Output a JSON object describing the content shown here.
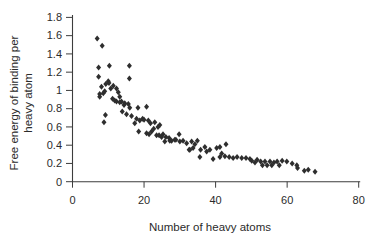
{
  "figure": {
    "background": "#ffffff",
    "marker_color": "#2e2e2e",
    "axis_color": "#3d3d3d",
    "text_color": "#2b2b2b"
  },
  "chart_data": {
    "type": "scatter",
    "title": "",
    "xlabel": "Number of heavy atoms",
    "ylabel": "Free energy of binding per heavy atom",
    "ylabel_lines": [
      "Free energy of binding per",
      "heavy atom"
    ],
    "xlim": [
      0,
      80
    ],
    "ylim": [
      0,
      1.8
    ],
    "xtick_values": [
      0,
      20,
      40,
      60,
      80
    ],
    "xtick_labels": [
      "0",
      "20",
      "40",
      "60",
      "80"
    ],
    "ytick_values": [
      0,
      0.2,
      0.4,
      0.6,
      0.8,
      1,
      1.2,
      1.4,
      1.6,
      1.8
    ],
    "ytick_labels": [
      "0",
      "0.2",
      "0.4",
      "0.6",
      "0.8",
      "1",
      "1.2",
      "1.4",
      "1.6",
      "1.8"
    ],
    "grid": false,
    "legend": null,
    "marker": "filled-diamond",
    "points": [
      [
        6.9,
        1.57
      ],
      [
        7.3,
        1.25
      ],
      [
        7.3,
        1.15
      ],
      [
        7.6,
        0.96
      ],
      [
        7.6,
        0.93
      ],
      [
        8.1,
        1.04
      ],
      [
        8.3,
        1.49
      ],
      [
        8.6,
        0.97
      ],
      [
        8.8,
        0.65
      ],
      [
        9.0,
        0.99
      ],
      [
        9.2,
        0.73
      ],
      [
        9.3,
        1.07
      ],
      [
        10.0,
        1.1
      ],
      [
        10.2,
        1.08
      ],
      [
        10.3,
        1.27
      ],
      [
        10.7,
        1.02
      ],
      [
        11.2,
        0.91
      ],
      [
        11.4,
        1.05
      ],
      [
        11.8,
        0.89
      ],
      [
        12.3,
        1.02
      ],
      [
        12.3,
        0.88
      ],
      [
        12.8,
        0.98
      ],
      [
        13.2,
        0.93
      ],
      [
        13.2,
        0.87
      ],
      [
        13.7,
        0.88
      ],
      [
        13.9,
        0.77
      ],
      [
        14.4,
        0.84
      ],
      [
        14.6,
        0.86
      ],
      [
        15.1,
        0.74
      ],
      [
        15.6,
        0.85
      ],
      [
        15.9,
        1.27
      ],
      [
        15.9,
        1.13
      ],
      [
        16.0,
        0.81
      ],
      [
        16.5,
        0.72
      ],
      [
        17.4,
        0.64
      ],
      [
        17.9,
        0.69
      ],
      [
        18.3,
        0.81
      ],
      [
        18.5,
        0.55
      ],
      [
        18.8,
        0.67
      ],
      [
        19.6,
        0.69
      ],
      [
        20.0,
        0.68
      ],
      [
        20.7,
        0.82
      ],
      [
        20.7,
        0.53
      ],
      [
        21.2,
        0.67
      ],
      [
        21.4,
        0.52
      ],
      [
        21.8,
        0.64
      ],
      [
        22.1,
        0.55
      ],
      [
        22.7,
        0.58
      ],
      [
        23.0,
        0.65
      ],
      [
        23.5,
        0.51
      ],
      [
        23.9,
        0.6
      ],
      [
        24.2,
        0.51
      ],
      [
        24.4,
        0.62
      ],
      [
        24.9,
        0.49
      ],
      [
        25.3,
        0.52
      ],
      [
        25.8,
        0.44
      ],
      [
        26.1,
        0.49
      ],
      [
        27.0,
        0.48
      ],
      [
        27.2,
        0.45
      ],
      [
        27.7,
        0.45
      ],
      [
        28.6,
        0.46
      ],
      [
        28.9,
        0.46
      ],
      [
        29.8,
        0.52
      ],
      [
        30.0,
        0.44
      ],
      [
        30.9,
        0.45
      ],
      [
        31.9,
        0.42
      ],
      [
        32.6,
        0.35
      ],
      [
        32.8,
        0.35
      ],
      [
        33.3,
        0.44
      ],
      [
        33.7,
        0.37
      ],
      [
        34.2,
        0.41
      ],
      [
        34.9,
        0.45
      ],
      [
        35.6,
        0.27
      ],
      [
        35.8,
        0.35
      ],
      [
        37.0,
        0.38
      ],
      [
        37.5,
        0.33
      ],
      [
        38.4,
        0.35
      ],
      [
        39.3,
        0.25
      ],
      [
        40.3,
        0.37
      ],
      [
        41.2,
        0.38
      ],
      [
        41.2,
        0.27
      ],
      [
        41.7,
        0.31
      ],
      [
        42.6,
        0.28
      ],
      [
        42.9,
        0.41
      ],
      [
        43.8,
        0.27
      ],
      [
        44.9,
        0.26
      ],
      [
        46.0,
        0.27
      ],
      [
        47.3,
        0.26
      ],
      [
        48.5,
        0.26
      ],
      [
        49.6,
        0.25
      ],
      [
        50.1,
        0.23
      ],
      [
        51.0,
        0.21
      ],
      [
        51.6,
        0.24
      ],
      [
        52.6,
        0.22
      ],
      [
        53.1,
        0.18
      ],
      [
        53.8,
        0.22
      ],
      [
        54.4,
        0.18
      ],
      [
        55.2,
        0.22
      ],
      [
        55.7,
        0.18
      ],
      [
        56.3,
        0.21
      ],
      [
        57.2,
        0.22
      ],
      [
        57.8,
        0.18
      ],
      [
        58.6,
        0.23
      ],
      [
        59.9,
        0.22
      ],
      [
        61.4,
        0.2
      ],
      [
        62.7,
        0.18
      ],
      [
        62.9,
        0.15
      ],
      [
        64.8,
        0.12
      ],
      [
        65.9,
        0.13
      ],
      [
        67.8,
        0.11
      ]
    ]
  }
}
